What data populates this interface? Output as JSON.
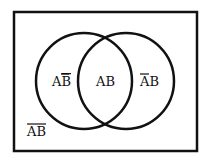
{
  "diagram": {
    "type": "venn",
    "sets": [
      "A",
      "B"
    ],
    "regions": {
      "a_not_b": {
        "prefix": "A",
        "overlined": "B"
      },
      "a_and_b": {
        "text": "AB"
      },
      "not_a_b": {
        "overlined": "A",
        "suffix": "B"
      },
      "complement": {
        "overlined": "AB"
      }
    },
    "colors": {
      "stroke": "#111111",
      "background": "#ffffff"
    }
  }
}
